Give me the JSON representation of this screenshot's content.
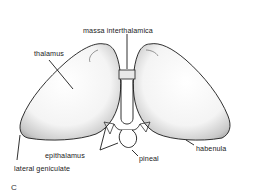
{
  "figure": {
    "panel_letter": "C",
    "labels": {
      "massa_interthalamica": "massa interthalamica",
      "thalamus": "thalamus",
      "epithalamus": "epithalamus",
      "pineal": "pineal",
      "habenula": "habenula",
      "lateral_geniculate": "lateral geniculate"
    },
    "colors": {
      "ink": "#1a1a1a",
      "shade": "#6b6b6b",
      "background": "#ffffff"
    }
  }
}
